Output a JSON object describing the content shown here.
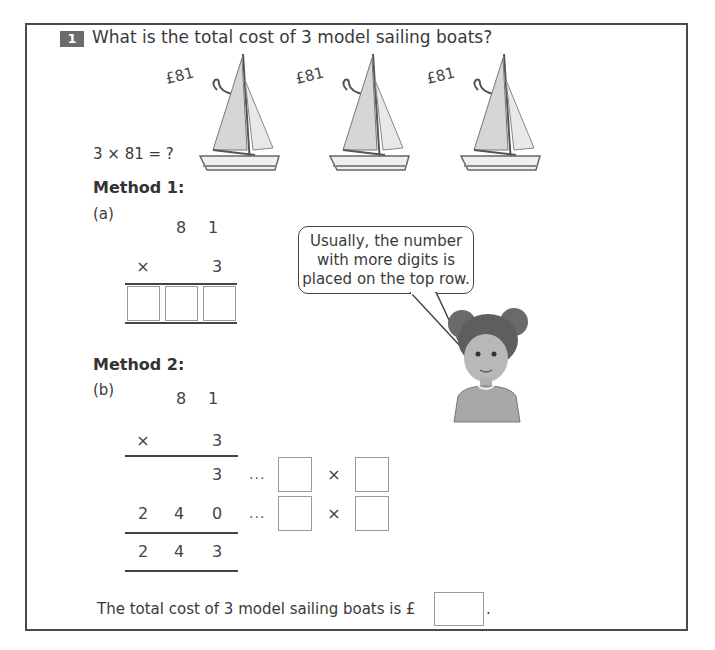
{
  "question": {
    "number": "1",
    "text": "What is the total cost of 3 model sailing boats?"
  },
  "boats": [
    {
      "price": "£81"
    },
    {
      "price": "£81"
    },
    {
      "price": "£81"
    }
  ],
  "equation": "3 × 81 = ?",
  "method1": {
    "heading": "Method 1:",
    "label": "(a)",
    "top_digits": [
      "8",
      "1"
    ],
    "operator": "×",
    "multiplier": "3",
    "answer_boxes": [
      "",
      "",
      ""
    ]
  },
  "speech_bubble": {
    "lines": [
      "Usually, the number",
      "with more digits is",
      "placed on the top row."
    ]
  },
  "method2": {
    "heading": "Method 2:",
    "label": "(b)",
    "top_digits": [
      "8",
      "1"
    ],
    "operator": "×",
    "multiplier": "3",
    "partial_rows": [
      {
        "digits": [
          "",
          "",
          "3"
        ],
        "dots": "...",
        "times": "×",
        "boxes": [
          "",
          ""
        ]
      },
      {
        "digits": [
          "2",
          "4",
          "0"
        ],
        "dots": "...",
        "times": "×",
        "boxes": [
          "",
          ""
        ]
      }
    ],
    "total_digits": [
      "2",
      "4",
      "3"
    ]
  },
  "conclusion": {
    "text": "The total cost of 3 model sailing boats is £",
    "answer": "",
    "end": "."
  }
}
